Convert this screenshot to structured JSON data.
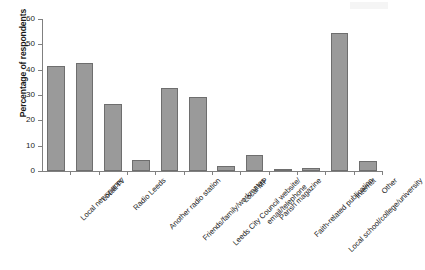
{
  "chart_data": {
    "type": "bar",
    "title": "",
    "xlabel": "",
    "ylabel": "Percentage of respondents",
    "ylim": [
      0,
      60
    ],
    "ytick_values": [
      0,
      10,
      20,
      30,
      40,
      50,
      60
    ],
    "ytick_labels": [
      "0",
      "10",
      "20",
      "30",
      "40",
      "50",
      "60"
    ],
    "grid": false,
    "legend": false,
    "bar_color": "#9a9a9a",
    "bar_edge_color": "#6e6e6e",
    "categories": [
      "Local newspaper",
      "Local TV",
      "Radio Leeds",
      "Another radio station",
      "Friends/family/workmates",
      "Leeds City Council website/\nemail/telephone",
      "Local MP",
      "Parish magazine",
      "Faith-related publication",
      "Local school/college/university",
      "Internet",
      "Other"
    ],
    "values": [
      41.5,
      42.5,
      26.5,
      4.2,
      32.8,
      29.1,
      2.1,
      6.2,
      0.7,
      1.1,
      54.6,
      4.0
    ]
  }
}
